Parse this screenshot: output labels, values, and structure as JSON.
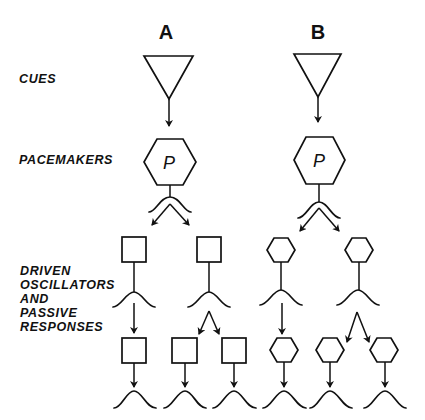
{
  "diagram": {
    "columns": [
      {
        "id": "A",
        "label": "A"
      },
      {
        "id": "B",
        "label": "B"
      }
    ],
    "row_labels": {
      "cues": "CUES",
      "pacemakers": "PACEMAKERS",
      "driven": [
        "DRIVEN",
        "OSCILLATORS",
        "AND",
        "PASSIVE",
        "RESPONSES"
      ]
    },
    "pacemaker_symbol": "P",
    "legend_shapes": {
      "cue": "inverted-triangle",
      "pacemaker": "hexagon",
      "passive_response": "square",
      "driven_oscillator": "hexagon",
      "rhythm": "wave"
    },
    "structure": {
      "A": {
        "cue": "triangle",
        "pacemaker": "hexagon-P",
        "level1": [
          "square",
          "square"
        ],
        "level2": [
          "square",
          "square",
          "square"
        ]
      },
      "B": {
        "cue": "triangle",
        "pacemaker": "hexagon-P",
        "level1": [
          "hexagon",
          "hexagon"
        ],
        "level2": [
          "hexagon",
          "hexagon",
          "hexagon"
        ]
      }
    }
  }
}
